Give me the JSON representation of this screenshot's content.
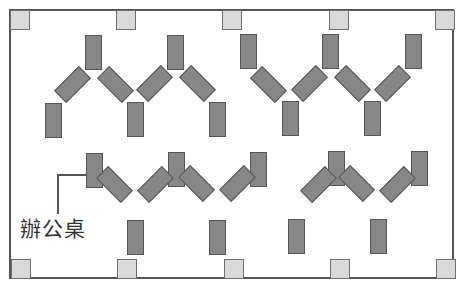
{
  "diagram": {
    "type": "office-floor-plan",
    "room": {
      "x": 9,
      "y": 9,
      "width": 445,
      "height": 270,
      "border_color": "#555555"
    },
    "colors": {
      "column_fill": "#d9d9d9",
      "desk_fill": "#878787",
      "outline": "#555555"
    },
    "label": {
      "text": "辦公桌",
      "x": 18,
      "y": 213
    },
    "caption": {
      "text": "（部分被裁切的說明文字）"
    },
    "columns": [
      {
        "x": 10,
        "y": 10
      },
      {
        "x": 116,
        "y": 10
      },
      {
        "x": 222,
        "y": 10
      },
      {
        "x": 329,
        "y": 10
      },
      {
        "x": 435,
        "y": 10
      },
      {
        "x": 11,
        "y": 259
      },
      {
        "x": 117,
        "y": 259
      },
      {
        "x": 224,
        "y": 259
      },
      {
        "x": 330,
        "y": 259
      },
      {
        "x": 436,
        "y": 259
      }
    ],
    "desks": [
      {
        "x": 85,
        "y": 35,
        "r": 0
      },
      {
        "x": 167,
        "y": 35,
        "r": 0
      },
      {
        "x": 240,
        "y": 34,
        "r": 0
      },
      {
        "x": 322,
        "y": 34,
        "r": 0
      },
      {
        "x": 405,
        "y": 34,
        "r": 0
      },
      {
        "x": 45,
        "y": 103,
        "r": 0
      },
      {
        "x": 127,
        "y": 102,
        "r": 0
      },
      {
        "x": 209,
        "y": 102,
        "r": 0
      },
      {
        "x": 282,
        "y": 101,
        "r": 0
      },
      {
        "x": 364,
        "y": 101,
        "r": 0
      },
      {
        "x": 64,
        "y": 67,
        "r": 45
      },
      {
        "x": 107,
        "y": 67,
        "r": -45
      },
      {
        "x": 146,
        "y": 66,
        "r": 45
      },
      {
        "x": 189,
        "y": 66,
        "r": -45
      },
      {
        "x": 260,
        "y": 67,
        "r": -45
      },
      {
        "x": 301,
        "y": 66,
        "r": 45
      },
      {
        "x": 344,
        "y": 66,
        "r": -45
      },
      {
        "x": 384,
        "y": 66,
        "r": 45
      },
      {
        "x": 86,
        "y": 153,
        "r": 0
      },
      {
        "x": 168,
        "y": 152,
        "r": 0
      },
      {
        "x": 250,
        "y": 152,
        "r": 0
      },
      {
        "x": 328,
        "y": 151,
        "r": 0
      },
      {
        "x": 411,
        "y": 151,
        "r": 0
      },
      {
        "x": 127,
        "y": 220,
        "r": 0
      },
      {
        "x": 209,
        "y": 220,
        "r": 0
      },
      {
        "x": 288,
        "y": 219,
        "r": 0
      },
      {
        "x": 370,
        "y": 219,
        "r": 0
      },
      {
        "x": 106,
        "y": 167,
        "r": -45
      },
      {
        "x": 147,
        "y": 167,
        "r": 45
      },
      {
        "x": 188,
        "y": 166,
        "r": -45
      },
      {
        "x": 229,
        "y": 166,
        "r": 45
      },
      {
        "x": 310,
        "y": 167,
        "r": 45
      },
      {
        "x": 348,
        "y": 166,
        "r": -45
      },
      {
        "x": 389,
        "y": 167,
        "r": 45
      }
    ]
  }
}
